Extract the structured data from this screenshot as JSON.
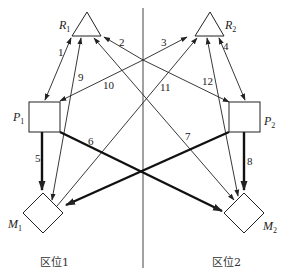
{
  "diagram": {
    "type": "flow-network",
    "divider": {
      "x": 143,
      "y1": 8,
      "y2": 268
    },
    "nodes": [
      {
        "id": "R1",
        "label": "R",
        "sub": "1",
        "shape": "triangle"
      },
      {
        "id": "R2",
        "label": "R",
        "sub": "2",
        "shape": "triangle"
      },
      {
        "id": "P1",
        "label": "P",
        "sub": "1",
        "shape": "square"
      },
      {
        "id": "P2",
        "label": "P",
        "sub": "2",
        "shape": "square"
      },
      {
        "id": "M1",
        "label": "M",
        "sub": "1",
        "shape": "diamond"
      },
      {
        "id": "M2",
        "label": "M",
        "sub": "2",
        "shape": "diamond"
      }
    ],
    "edges": [
      {
        "num": "1",
        "from": "R1",
        "to": "P1",
        "bidirectional": true,
        "thick": false
      },
      {
        "num": "2",
        "from": "P2",
        "to": "R1",
        "bidirectional": false,
        "thick": false
      },
      {
        "num": "3",
        "from": "P1",
        "to": "R2",
        "bidirectional": false,
        "thick": false
      },
      {
        "num": "4",
        "from": "R2",
        "to": "P2",
        "bidirectional": true,
        "thick": false
      },
      {
        "num": "5",
        "from": "P1",
        "to": "M1",
        "bidirectional": false,
        "thick": true
      },
      {
        "num": "6",
        "from": "P1",
        "to": "M2",
        "bidirectional": false,
        "thick": true
      },
      {
        "num": "7",
        "from": "R1",
        "to": "M2",
        "bidirectional": false,
        "thick": false
      },
      {
        "num": "8",
        "from": "P2",
        "to": "M2",
        "bidirectional": false,
        "thick": true
      },
      {
        "num": "9",
        "from": "M1",
        "to": "R1",
        "bidirectional": false,
        "thick": false
      },
      {
        "num": "10",
        "from": "P2",
        "to": "P1",
        "bidirectional": false,
        "thick": false
      },
      {
        "num": "11",
        "from": "M1",
        "to": "R2",
        "bidirectional": false,
        "thick": false
      },
      {
        "num": "12",
        "from": "M2",
        "to": "R2",
        "bidirectional": false,
        "thick": false
      }
    ],
    "zones": [
      {
        "label": "区位1"
      },
      {
        "label": "区位2"
      }
    ],
    "colors": {
      "line": "#222222",
      "background": "#ffffff"
    }
  }
}
